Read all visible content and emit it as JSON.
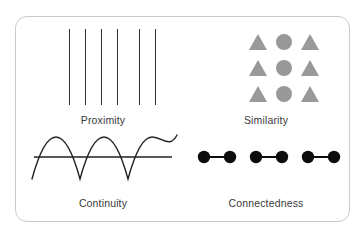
{
  "diagram": {
    "background_color": "#ffffff",
    "card": {
      "border_color": "#c9c9c9",
      "fill_color": "#ffffff",
      "corner_radius": "12px"
    },
    "panels": [
      {
        "id": "proximity",
        "caption": "Proximity",
        "figure_type": "vertical-lines",
        "stroke_color": "#333333",
        "line_count": 6,
        "line_x_positions": [
          47,
          63,
          79,
          95,
          117,
          133
        ],
        "line_height": 76,
        "group_description": "Six vertical lines with a wider gap between the fourth and fifth, forming two perceptual groups"
      },
      {
        "id": "similarity",
        "caption": "Similarity",
        "figure_type": "shape-grid",
        "shape_color": "#999999",
        "rows": 3,
        "columns": 3,
        "grid": [
          [
            "triangle",
            "circle",
            "triangle"
          ],
          [
            "triangle",
            "circle",
            "triangle"
          ],
          [
            "triangle",
            "circle",
            "triangle"
          ]
        ],
        "column_x_positions": [
          72,
          98,
          124
        ],
        "row_y_positions": [
          4,
          30,
          56
        ],
        "group_description": "Middle column of circles separates from surrounding triangles"
      },
      {
        "id": "continuity",
        "caption": "Continuity",
        "figure_type": "wave-crossing-line",
        "stroke_color": "#222222",
        "baseline_y": 30,
        "baseline_x_start": 12,
        "baseline_x_end": 150,
        "wave_amplitude": 22,
        "wave_cycles": 3,
        "wave_x_start": 10,
        "wave_x_end": 155,
        "group_description": "A sine wave and a straight horizontal line read as two continuous paths"
      },
      {
        "id": "connectedness",
        "caption": "Connectedness",
        "figure_type": "connected-dots",
        "dot_color": "#0d0d0d",
        "connector_color": "#0d0d0d",
        "dot_count": 6,
        "pair_count": 3,
        "dot_radius": 6,
        "dot_y": 30,
        "dot_x_positions": [
          18,
          44,
          70,
          96,
          122,
          148
        ],
        "connections": [
          [
            0,
            1
          ],
          [
            2,
            3
          ],
          [
            4,
            5
          ]
        ],
        "group_description": "Six dots joined in three linked pairs"
      }
    ]
  }
}
